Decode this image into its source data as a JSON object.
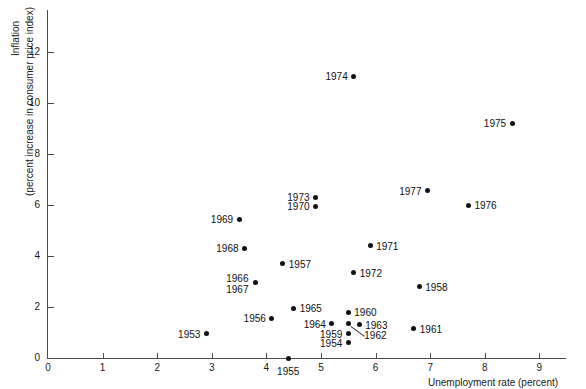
{
  "chart_data": {
    "type": "scatter",
    "title": "",
    "xlabel": "Unemployment rate (percent)",
    "ylabel_line1": "Inflation",
    "ylabel_line2": "(percent increase in consumer price index)",
    "xlim": [
      0,
      9
    ],
    "ylim": [
      0,
      13.5
    ],
    "xticks": [
      0,
      1,
      2,
      3,
      4,
      5,
      6,
      7,
      8,
      9
    ],
    "xtick_labels": [
      "0",
      "1",
      "2",
      "3",
      "4",
      "5",
      "6",
      "7",
      "8",
      "9"
    ],
    "yticks": [
      0,
      2,
      4,
      6,
      8,
      10,
      12
    ],
    "ytick_labels": [
      "0",
      "2",
      "4",
      "6",
      "8",
      "10",
      "12"
    ],
    "grid": false,
    "legend": "none",
    "marker_color": "#111111",
    "axis_color": "#4a4a4a",
    "points": [
      {
        "label": "1953",
        "x": 2.9,
        "y": 0.95,
        "label_pos": "left"
      },
      {
        "label": "1954",
        "x": 5.5,
        "y": 0.6,
        "label_pos": "left"
      },
      {
        "label": "1955",
        "x": 4.4,
        "y": 0.0,
        "label_pos": "below"
      },
      {
        "label": "1956",
        "x": 4.1,
        "y": 1.55,
        "label_pos": "left"
      },
      {
        "label": "1957",
        "x": 4.3,
        "y": 3.7,
        "label_pos": "right"
      },
      {
        "label": "1958",
        "x": 6.8,
        "y": 2.8,
        "label_pos": "right"
      },
      {
        "label": "1959",
        "x": 5.5,
        "y": 0.95,
        "label_pos": "left"
      },
      {
        "label": "1960",
        "x": 5.5,
        "y": 1.8,
        "label_pos": "right"
      },
      {
        "label": "1961",
        "x": 6.7,
        "y": 1.15,
        "label_pos": "right"
      },
      {
        "label": "1962",
        "x": 5.5,
        "y": 1.35,
        "label_pos": "leader"
      },
      {
        "label": "1963",
        "x": 5.7,
        "y": 1.3,
        "label_pos": "right"
      },
      {
        "label": "1964",
        "x": 5.2,
        "y": 1.35,
        "label_pos": "left"
      },
      {
        "label": "1965",
        "x": 4.5,
        "y": 1.95,
        "label_pos": "right"
      },
      {
        "label": "1966",
        "x": 3.8,
        "y": 2.95,
        "label_pos": "stack-upper"
      },
      {
        "label": "1967",
        "x": 3.8,
        "y": 2.95,
        "label_pos": "stack-lower"
      },
      {
        "label": "1968",
        "x": 3.6,
        "y": 4.3,
        "label_pos": "left"
      },
      {
        "label": "1969",
        "x": 3.5,
        "y": 5.45,
        "label_pos": "left"
      },
      {
        "label": "1970",
        "x": 4.9,
        "y": 5.95,
        "label_pos": "left"
      },
      {
        "label": "1971",
        "x": 5.9,
        "y": 4.4,
        "label_pos": "right"
      },
      {
        "label": "1972",
        "x": 5.6,
        "y": 3.35,
        "label_pos": "right"
      },
      {
        "label": "1973",
        "x": 4.9,
        "y": 6.3,
        "label_pos": "left"
      },
      {
        "label": "1974",
        "x": 5.6,
        "y": 11.05,
        "label_pos": "left"
      },
      {
        "label": "1975",
        "x": 8.5,
        "y": 9.2,
        "label_pos": "left"
      },
      {
        "label": "1976",
        "x": 7.7,
        "y": 6.0,
        "label_pos": "right"
      },
      {
        "label": "1977",
        "x": 6.95,
        "y": 6.55,
        "label_pos": "left"
      }
    ]
  }
}
